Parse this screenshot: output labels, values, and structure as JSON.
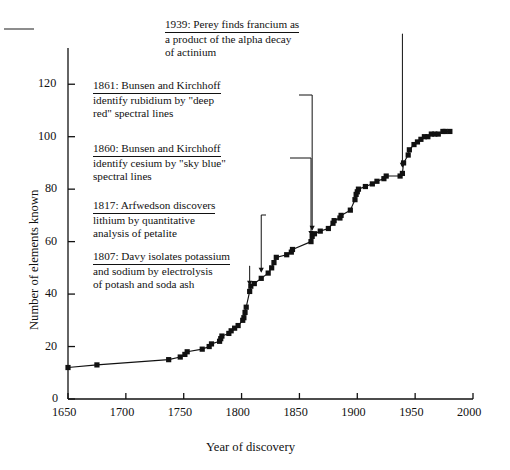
{
  "chart_data": {
    "type": "line",
    "title": "",
    "xlabel": "Year of discovery",
    "ylabel": "Number of elements known",
    "xlim": [
      1650,
      2000
    ],
    "ylim": [
      0,
      130
    ],
    "xticks": [
      1650,
      1700,
      1750,
      1800,
      1850,
      1900,
      1950,
      2000
    ],
    "yticks": [
      0,
      20,
      40,
      60,
      80,
      100,
      120
    ],
    "grid": false,
    "legend": null,
    "marker": "filled-square",
    "series": [
      {
        "name": "Cumulative elements known",
        "x": [
          1650,
          1675,
          1737,
          1747,
          1751,
          1753,
          1766,
          1772,
          1774,
          1781,
          1782,
          1783,
          1789,
          1791,
          1794,
          1797,
          1801,
          1802,
          1803,
          1804,
          1807,
          1808,
          1811,
          1817,
          1823,
          1826,
          1828,
          1830,
          1839,
          1843,
          1844,
          1860,
          1861,
          1863,
          1868,
          1875,
          1879,
          1880,
          1885,
          1886,
          1894,
          1898,
          1899,
          1900,
          1901,
          1907,
          1913,
          1917,
          1923,
          1925,
          1937,
          1939,
          1940,
          1944,
          1945,
          1949,
          1952,
          1955,
          1958,
          1961,
          1964,
          1967,
          1970,
          1974,
          1976,
          1980
        ],
        "y": [
          12,
          13,
          15,
          16,
          17,
          18,
          19,
          20,
          21,
          22,
          23,
          24,
          25,
          26,
          27,
          28,
          30,
          31,
          33,
          35,
          41,
          43,
          44,
          46,
          48,
          50,
          52,
          54,
          55,
          56,
          57,
          60,
          62,
          63,
          64,
          65,
          67,
          68,
          69,
          70,
          72,
          76,
          78,
          79,
          80,
          81,
          82,
          83,
          84,
          85,
          85,
          86,
          90,
          93,
          95,
          97,
          98,
          99,
          100,
          100,
          101,
          101,
          101,
          102,
          102,
          102
        ]
      }
    ],
    "annotations": [
      {
        "id": "francium-1939",
        "lines": [
          "1939: Perey finds francium as",
          "a product of the alpha decay",
          "of actinium"
        ],
        "target_x": 1939,
        "target_y": 86
      },
      {
        "id": "rubidium-1861",
        "lines": [
          "1861: Bunsen and Kirchhoff",
          "identify rubidium by \"deep",
          "red\" spectral lines"
        ],
        "target_x": 1861,
        "target_y": 62
      },
      {
        "id": "cesium-1860",
        "lines": [
          "1860: Bunsen and Kirchhoff",
          "identify cesium by \"sky blue\"",
          "spectral lines"
        ],
        "target_x": 1860,
        "target_y": 60
      },
      {
        "id": "lithium-1817",
        "lines": [
          "1817: Arfwedson discovers",
          "lithium by quantitative",
          "analysis of petalite"
        ],
        "target_x": 1817,
        "target_y": 46
      },
      {
        "id": "potassium-1807",
        "lines": [
          "1807: Davy isolates potassium",
          "and sodium by electrolysis",
          "of potash and soda ash"
        ],
        "target_x": 1807,
        "target_y": 41
      }
    ]
  },
  "axes": {
    "x_title": "Year of discovery",
    "y_title": "Number of elements known",
    "x_tick_labels": [
      "1650",
      "1700",
      "1750",
      "1800",
      "1850",
      "1900",
      "1950",
      "2000"
    ],
    "y_tick_labels": [
      "0",
      "20",
      "40",
      "60",
      "80",
      "100",
      "120"
    ]
  },
  "colors": {
    "ink": "#111111",
    "curve": "#111111",
    "background": "#ffffff"
  }
}
